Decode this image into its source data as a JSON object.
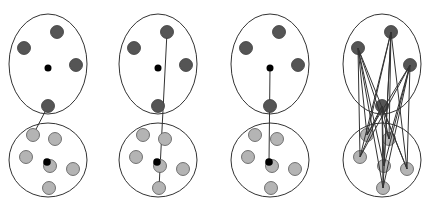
{
  "diagram": {
    "colors": {
      "background": "#ffffff",
      "outline": "#333333",
      "cluster_a_point": "#555555",
      "cluster_b_point": "#b4b4b4",
      "centroid": "#000000",
      "link": "#333333"
    },
    "panels": [
      {
        "id": "single-link",
        "offset_x": 0,
        "link_type": "nearest-pair"
      },
      {
        "id": "complete-link",
        "offset_x": 110,
        "link_type": "farthest-pair"
      },
      {
        "id": "centroid-link",
        "offset_x": 222,
        "link_type": "centroid-to-centroid"
      },
      {
        "id": "average-link",
        "offset_x": 334,
        "link_type": "all-pairs"
      }
    ],
    "cluster_a": {
      "shape": {
        "cx": 48,
        "cy": 64,
        "rx": 39,
        "ry": 50
      },
      "points": [
        [
          57,
          32
        ],
        [
          24,
          48
        ],
        [
          76,
          65
        ],
        [
          48,
          106
        ]
      ],
      "centroid": [
        48,
        68
      ]
    },
    "cluster_b": {
      "shape": {
        "cx": 48,
        "cy": 160,
        "rx": 39,
        "ry": 37
      },
      "points": [
        [
          33,
          135
        ],
        [
          55,
          139
        ],
        [
          26,
          157
        ],
        [
          50,
          166
        ],
        [
          73,
          169
        ],
        [
          49,
          188
        ]
      ],
      "centroid": [
        47,
        162
      ]
    }
  }
}
